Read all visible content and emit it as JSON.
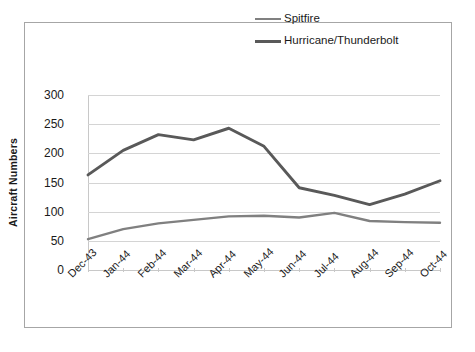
{
  "chart_data": {
    "type": "line",
    "title": "",
    "xlabel": "",
    "ylabel": "Aircraft Numbers",
    "categories": [
      "Dec-43",
      "Jan-44",
      "Feb-44",
      "Mar-44",
      "Apr-44",
      "May-44",
      "Jun-44",
      "Jul-44",
      "Aug-44",
      "Sep-44",
      "Oct-44"
    ],
    "series": [
      {
        "name": "Spitfire",
        "color": "#808080",
        "values": [
          53,
          70,
          80,
          86,
          92,
          93,
          90,
          98,
          84,
          82,
          81
        ]
      },
      {
        "name": "Hurricane/Thunderbolt",
        "color": "#595959",
        "values": [
          163,
          205,
          232,
          223,
          243,
          212,
          141,
          128,
          112,
          130,
          153
        ]
      }
    ],
    "ylim": [
      0,
      300
    ],
    "y_ticks": [
      0,
      50,
      100,
      150,
      200,
      250,
      300
    ],
    "y_tick_labels": [
      "0",
      "50",
      "100",
      "150",
      "200",
      "250",
      "300"
    ],
    "grid": true,
    "legend_position": "top-right",
    "plot_background": "#ffffff",
    "gridline_color": "#d4d4d4",
    "border_color": "#a6a6a6"
  },
  "legend": {
    "entries": [
      {
        "label": "Spitfire",
        "swatch": "line-swatch-light"
      },
      {
        "label": "Hurricane/Thunderbolt",
        "swatch": "line-swatch-dark"
      }
    ]
  }
}
